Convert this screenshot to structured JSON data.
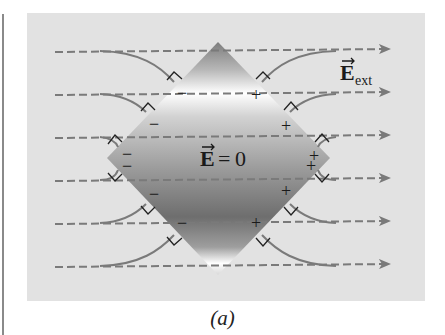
{
  "figure": {
    "caption": "(a)",
    "conductor_label": "E = 0",
    "conductor_label_parts": {
      "vector": "E",
      "equals": "=",
      "value": "0"
    },
    "external_field_label": {
      "vector": "E",
      "subscript": "ext"
    },
    "field_lines_count": 6,
    "surface_charges": {
      "left": [
        "−",
        "−",
        "−",
        "−",
        "−",
        "−",
        "−"
      ],
      "right": [
        "+",
        "+",
        "+",
        "+",
        "+",
        "+",
        "+"
      ]
    },
    "colors": {
      "panel_background": "#e2e2e2",
      "field_line": "#7a7a7a",
      "conductor_dark": "#6e6e6e",
      "conductor_light": "#ffffff",
      "text": "#1a1a1a"
    }
  }
}
